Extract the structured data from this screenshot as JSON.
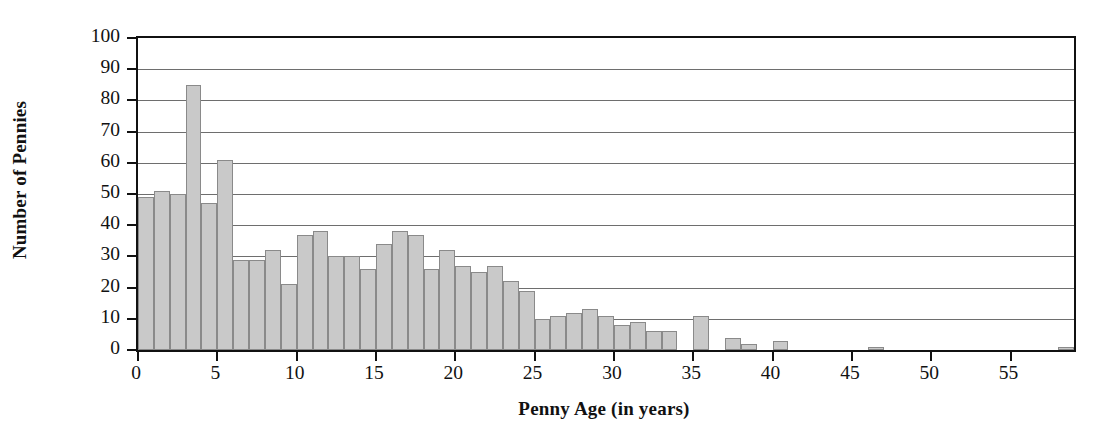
{
  "chart_data": {
    "type": "bar",
    "title": "",
    "subtitle": "",
    "xlabel": "Penny Age (in years)",
    "ylabel": "Number of Pennies",
    "xlim": [
      0,
      59
    ],
    "ylim": [
      0,
      100
    ],
    "grid": true,
    "legend": null,
    "bin_width": 1,
    "y_ticks": [
      0,
      10,
      20,
      30,
      40,
      50,
      60,
      70,
      80,
      90,
      100
    ],
    "x_ticks": [
      0,
      5,
      10,
      15,
      20,
      25,
      30,
      35,
      40,
      45,
      50,
      55
    ],
    "bar_fill": "#c9c9c9",
    "bar_edge": "#8a8a8a",
    "axis_color": "#111111",
    "grid_color": "#6e6e6e",
    "categories": [
      0,
      1,
      2,
      3,
      4,
      5,
      6,
      7,
      8,
      9,
      10,
      11,
      12,
      13,
      14,
      15,
      16,
      17,
      18,
      19,
      20,
      21,
      22,
      23,
      24,
      25,
      26,
      27,
      28,
      29,
      30,
      31,
      32,
      33,
      34,
      35,
      36,
      37,
      38,
      39,
      40,
      41,
      42,
      43,
      44,
      45,
      46,
      47,
      48,
      49,
      50,
      51,
      52,
      53,
      54,
      55,
      56,
      57,
      58
    ],
    "values": [
      49,
      51,
      50,
      85,
      47,
      61,
      29,
      29,
      32,
      21,
      37,
      38,
      30,
      30,
      26,
      34,
      38,
      37,
      26,
      32,
      27,
      25,
      27,
      22,
      19,
      10,
      11,
      12,
      13,
      11,
      8,
      9,
      6,
      6,
      0,
      11,
      0,
      4,
      2,
      0,
      3,
      0,
      0,
      0,
      0,
      0,
      1,
      0,
      0,
      0,
      0,
      0,
      0,
      0,
      0,
      0,
      0,
      0,
      1
    ]
  }
}
